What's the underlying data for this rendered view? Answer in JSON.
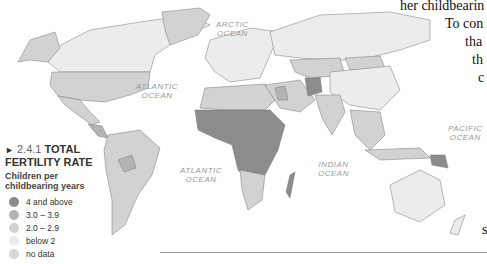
{
  "legend": {
    "section_number": "2.4.1",
    "title_line1": "TOTAL",
    "title_line2": "FERTILITY RATE",
    "subtitle_line1": "Children per",
    "subtitle_line2": "childbearing years",
    "items": [
      {
        "label": "4 and above",
        "color": "#8c8c8c"
      },
      {
        "label": "3.0 – 3.9",
        "color": "#b4b4b4"
      },
      {
        "label": "2.0 – 2.9",
        "color": "#d2d2d2"
      },
      {
        "label": "below 2",
        "color": "#ececec"
      },
      {
        "label": "no data",
        "color": "#d8d8d8"
      }
    ]
  },
  "oceans": {
    "arctic": [
      "ARCTIC",
      "OCEAN"
    ],
    "atlantic_north": [
      "ATLANTIC",
      "OCEAN"
    ],
    "atlantic_south": [
      "ATLANTIC",
      "OCEAN"
    ],
    "indian": [
      "INDIAN",
      "OCEAN"
    ],
    "pacific": [
      "PACIFIC",
      "OCEAN"
    ]
  },
  "side_text": {
    "line1": "her childbearin",
    "line2": "To con",
    "line3": "tha",
    "line4": "th",
    "line5": "c",
    "line6": "s"
  }
}
